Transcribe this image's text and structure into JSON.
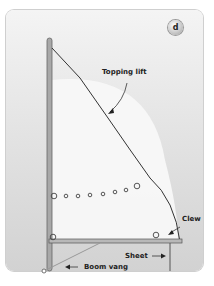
{
  "figure": {
    "badge": "d",
    "labels": {
      "topping_lift": "Topping lift",
      "clew": "Clew",
      "sheet": "Sheet",
      "boom_vang": "Boom vang"
    },
    "colors": {
      "panel_top": "#f4f4f4",
      "panel_bottom": "#d2d2d2",
      "sail": "#f7f7f7",
      "rigging": "#333333",
      "mast": "#9a9a9a"
    },
    "reef_points_count": 8
  }
}
